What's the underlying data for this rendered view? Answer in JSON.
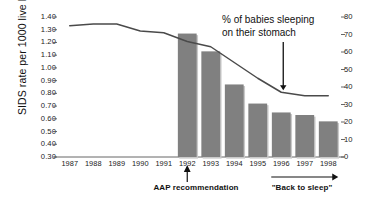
{
  "chart_data": {
    "type": "bar",
    "title": "",
    "categories": [
      "1987",
      "1988",
      "1989",
      "1990",
      "1991",
      "1992",
      "1993",
      "1994",
      "1995",
      "1996",
      "1997",
      "1998"
    ],
    "ylabel": "SIDS rate per 1000 live births",
    "ylabel_right": "",
    "xlabel": "",
    "ylim": [
      0.3,
      1.4
    ],
    "ylim_right": [
      0,
      80
    ],
    "grid": false,
    "legend_position": "none",
    "yticks": [
      "1.40",
      "1.30",
      "1.20",
      "1.10",
      "1.00",
      "0.90",
      "0.80",
      "0.70",
      "0.60",
      "0.50",
      "0.40",
      "0.30"
    ],
    "ytick_values": [
      1.4,
      1.3,
      1.2,
      1.1,
      1.0,
      0.9,
      0.8,
      0.7,
      0.6,
      0.5,
      0.4,
      0.3
    ],
    "yticks_right": [
      "80",
      "70",
      "60",
      "50",
      "40",
      "30",
      "20",
      "10",
      "0"
    ],
    "ytick_right_values": [
      80,
      70,
      60,
      50,
      40,
      30,
      20,
      10,
      0
    ],
    "series": [
      {
        "name": "SIDS rate per 1000 live births",
        "type": "bar",
        "axis": "left",
        "color": "#808080",
        "values": [
          null,
          null,
          null,
          null,
          null,
          1.27,
          1.13,
          0.87,
          0.72,
          0.65,
          0.63,
          0.58
        ]
      },
      {
        "name": "% of babies sleeping on their stomach",
        "type": "line",
        "axis": "right",
        "color": "#4a4a4a",
        "values": [
          75,
          76,
          76,
          72,
          71,
          66,
          63,
          54,
          45,
          37,
          35,
          35
        ]
      }
    ],
    "annotations": [
      {
        "name": "line-series-callout",
        "line1": "% of babies sleeping",
        "line2": "on their stomach"
      },
      {
        "name": "aap-note",
        "text": "AAP recommendation",
        "points_to": "1992"
      },
      {
        "name": "back-to-sleep-note",
        "text": "\"Back to sleep\"",
        "span": "1996-1998"
      }
    ]
  },
  "axes": {
    "y_left_label": "SIDS rate per 1000 live births"
  },
  "colors": {
    "bar": "#808080",
    "line": "#4a4a4a",
    "axis": "#555555",
    "text": "#111111",
    "background": "#ffffff"
  }
}
